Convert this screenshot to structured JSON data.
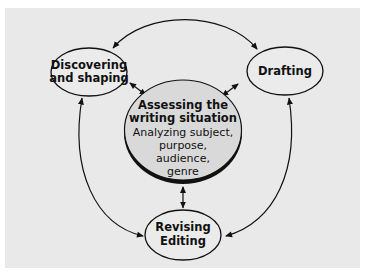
{
  "colors": {
    "background_panel": "#e9e9e9",
    "outer": "#ffffff",
    "node_fill": "#ebebeb",
    "center_fill": "#d9d9d9",
    "stroke": "#111111"
  },
  "nodes": {
    "discovering": {
      "line1": "Discovering",
      "line2": "and shaping"
    },
    "drafting": {
      "line1": "Drafting"
    },
    "center": {
      "title1": "Assessing the",
      "title2": "writing situation",
      "body1": "Analyzing subject,",
      "body2": "purpose,",
      "body3": "audience,",
      "body4": "genre"
    },
    "revising": {
      "line1": "Revising",
      "line2": "Editing"
    }
  },
  "connections": [
    {
      "from": "drafting",
      "to": "discovering",
      "type": "curved-arrow"
    },
    {
      "from": "revising",
      "to": "discovering",
      "type": "curved-arrow"
    },
    {
      "from": "revising",
      "to": "drafting",
      "type": "curved-arrow"
    },
    {
      "from": "center",
      "to": "discovering",
      "type": "double-arrow"
    },
    {
      "from": "center",
      "to": "drafting",
      "type": "double-arrow"
    },
    {
      "from": "center",
      "to": "revising",
      "type": "double-arrow"
    }
  ]
}
